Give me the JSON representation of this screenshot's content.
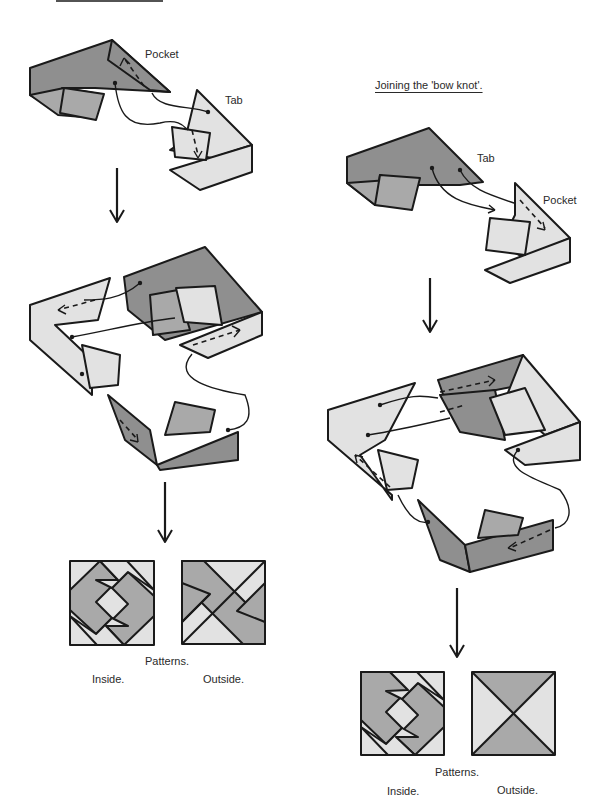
{
  "left_column": {
    "title_underline": "",
    "step1": {
      "labels": {
        "pocket": "Pocket",
        "tab": "Tab"
      }
    },
    "patterns": {
      "caption": "Patterns.",
      "inside": "Inside.",
      "outside": "Outside."
    }
  },
  "right_column": {
    "title": "Joining the 'bow knot'.",
    "step1": {
      "labels": {
        "tab": "Tab",
        "pocket": "Pocket"
      }
    },
    "patterns": {
      "caption": "Patterns.",
      "inside": "Inside.",
      "outside": "Outside."
    }
  },
  "colors": {
    "dark": "#8f8f8f",
    "medium": "#a9a9a9",
    "light": "#e2e2e2",
    "line": "#1a1a1a"
  }
}
